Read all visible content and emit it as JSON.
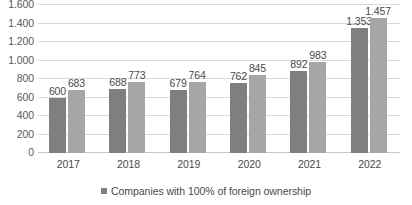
{
  "chart_data": {
    "type": "bar",
    "title": "",
    "subtitle": "",
    "xlabel": "",
    "ylabel": "",
    "categories": [
      "2017",
      "2018",
      "2019",
      "2020",
      "2021",
      "2022"
    ],
    "series": [
      {
        "name": "Companies with 100% of foreign ownership",
        "color": "#7f7f7f",
        "values": [
          600,
          688,
          679,
          762,
          892,
          1353
        ],
        "labels": [
          "600",
          "688",
          "679",
          "762",
          "892",
          "1.353"
        ]
      },
      {
        "name": "",
        "color": "#a6a6a6",
        "values": [
          683,
          773,
          764,
          845,
          983,
          1457
        ],
        "labels": [
          "683",
          "773",
          "764",
          "845",
          "983",
          "1.457"
        ]
      }
    ],
    "ylim": [
      0,
      1600
    ],
    "y_ticks": [
      0,
      200,
      400,
      600,
      800,
      1000,
      1200,
      1400,
      1600
    ],
    "y_tick_labels": [
      "0",
      "200",
      "400",
      "600",
      "800",
      "1.000",
      "1.200",
      "1.400",
      "1.600"
    ],
    "grid": true,
    "legend_position": "bottom",
    "legend_entries": [
      "Companies with 100% of foreign ownership"
    ]
  },
  "legend": {
    "item_0": "Companies with 100% of foreign ownership"
  }
}
